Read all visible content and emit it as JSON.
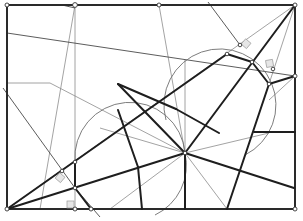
{
  "diagram": {
    "type": "geometric-construction",
    "colors": {
      "background": "#ffffff",
      "thick_line": "#1e1e1e",
      "thin_line": "#8c8c8c",
      "arc": "#6e6e6e",
      "marker_fill": "#e6e6e6"
    },
    "frame": {
      "x1": 7,
      "y1": 5,
      "x2": 295,
      "y2": 209
    },
    "points": [
      {
        "id": "top-left-corner",
        "x": 7,
        "y": 5
      },
      {
        "id": "top-point-b",
        "x": 75,
        "y": 5
      },
      {
        "id": "top-point-c",
        "x": 159,
        "y": 5
      },
      {
        "id": "top-right-corner",
        "x": 295,
        "y": 5
      },
      {
        "id": "right-point",
        "x": 295,
        "y": 76
      },
      {
        "id": "bottom-right-corner",
        "x": 295,
        "y": 209
      },
      {
        "id": "bottom-left-corner",
        "x": 7,
        "y": 209
      },
      {
        "id": "bottom-point-g",
        "x": 75,
        "y": 209
      },
      {
        "id": "bottom-point-h",
        "x": 91,
        "y": 209
      },
      {
        "id": "hub",
        "x": 185,
        "y": 153
      },
      {
        "id": "upper-vertex-1",
        "x": 227,
        "y": 54
      },
      {
        "id": "upper-vertex-2",
        "x": 252,
        "y": 62
      },
      {
        "id": "upper-foot-1",
        "x": 240,
        "y": 45
      },
      {
        "id": "upper-foot-2",
        "x": 273,
        "y": 69
      },
      {
        "id": "right-vertex",
        "x": 269,
        "y": 84
      },
      {
        "id": "left-vertex-1",
        "x": 75,
        "y": 162
      },
      {
        "id": "left-vertex-2",
        "x": 75,
        "y": 188
      },
      {
        "id": "left-foot",
        "x": 62,
        "y": 171
      }
    ],
    "circles": [
      {
        "id": "upper-circle",
        "cx": 222,
        "cy": 104,
        "r": 56
      },
      {
        "id": "lower-circle",
        "cx": 130,
        "cy": 168,
        "r": 55
      }
    ]
  }
}
